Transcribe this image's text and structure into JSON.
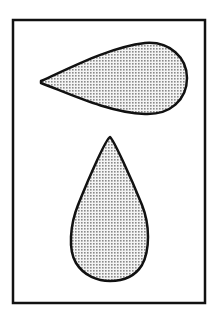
{
  "figure": {
    "frame": {
      "x": 13,
      "y": 20,
      "width": 192,
      "height": 283,
      "stroke": "#111111",
      "stroke_width": 2.5
    },
    "fill_pattern": {
      "dot_color": "#8a8a8a",
      "background": "#f2f2f2",
      "spacing": 3
    },
    "shapes": [
      {
        "name": "horizontal-teardrop",
        "orientation": "pointing-left",
        "tip": [
          41,
          81
        ],
        "bulb_right": 187,
        "top": 42,
        "bottom": 115
      },
      {
        "name": "vertical-teardrop",
        "orientation": "pointing-up",
        "tip": [
          110,
          137
        ],
        "bottom": 280,
        "left": 72,
        "right": 149
      }
    ],
    "outline_color": "#111111"
  }
}
